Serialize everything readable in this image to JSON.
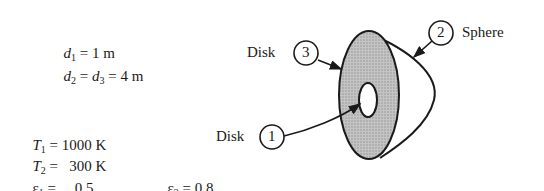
{
  "given": {
    "d1": {
      "var": "d",
      "sub": "1",
      "rest": " = 1 m"
    },
    "d23": {
      "var1": "d",
      "sub1": "2",
      "mid": " = ",
      "var2": "d",
      "sub2": "3",
      "rest": " = 4 m"
    },
    "T1": {
      "var": "T",
      "sub": "1",
      "rest": " = 1000 K"
    },
    "T2": {
      "var": "T",
      "sub": "2",
      "rest": " =   300 K"
    },
    "e1": {
      "var": "ε",
      "sub": "1",
      "rest": " =     0.5"
    },
    "e2": {
      "var": "ε",
      "sub": "2",
      "rest": " = 0.8"
    }
  },
  "labels": {
    "disk3_text": "Disk",
    "disk3_num": "3",
    "sphere_num": "2",
    "sphere_text": "Sphere",
    "disk1_text": "Disk",
    "disk1_num": "1"
  },
  "colors": {
    "fill": "#bdbdbd",
    "stroke": "#1a1a1a"
  }
}
